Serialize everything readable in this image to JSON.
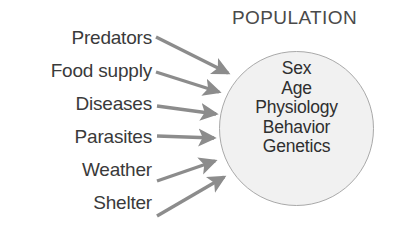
{
  "diagram": {
    "title": "POPULATION",
    "circle": {
      "fill_color": "#f1f1f1",
      "border_color": "#a9a9a9",
      "attributes": [
        "Sex",
        "Age",
        "Physiology",
        "Behavior",
        "Genetics"
      ]
    },
    "arrow_color": "#8c8c8c",
    "text_color": "#3a3a3a",
    "factors": [
      {
        "label": "Predators",
        "top": 28
      },
      {
        "label": "Food supply",
        "top": 61
      },
      {
        "label": "Diseases",
        "top": 94
      },
      {
        "label": "Parasites",
        "top": 127
      },
      {
        "label": "Weather",
        "top": 160
      },
      {
        "label": "Shelter",
        "top": 193
      }
    ],
    "arrows": [
      {
        "name": "arrow-predators",
        "x1": 156,
        "y1": 37,
        "x2": 228,
        "y2": 73
      },
      {
        "name": "arrow-food-supply",
        "x1": 156,
        "y1": 72,
        "x2": 219,
        "y2": 92
      },
      {
        "name": "arrow-diseases",
        "x1": 157,
        "y1": 106,
        "x2": 216,
        "y2": 114
      },
      {
        "name": "arrow-parasites",
        "x1": 157,
        "y1": 136,
        "x2": 214,
        "y2": 138
      },
      {
        "name": "arrow-weather",
        "x1": 157,
        "y1": 181,
        "x2": 215,
        "y2": 161
      },
      {
        "name": "arrow-shelter",
        "x1": 157,
        "y1": 216,
        "x2": 224,
        "y2": 177
      }
    ]
  }
}
